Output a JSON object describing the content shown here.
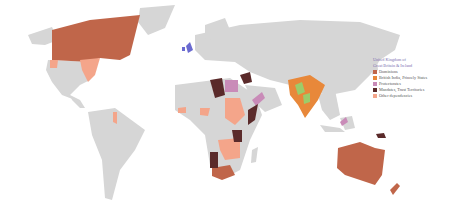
{
  "map": {
    "title": "British Empire territories",
    "land_color": "#d6d6d6",
    "ocean_color": "#ffffff"
  },
  "legend": {
    "title_line1": "United Kingdom of",
    "title_line2": "Great Britain & Ireland",
    "uk_color": "#6a6ad0",
    "items": [
      {
        "label": "Dominions",
        "color": "#c0664a"
      },
      {
        "label": "British India, Princely States",
        "color": "#e8883a"
      },
      {
        "label": "Protectorates",
        "color": "#c98bb8"
      },
      {
        "label": "Mandates, Trust Territories",
        "color": "#5a2a2a"
      },
      {
        "label": "Other dependencies",
        "color": "#f4a58a"
      }
    ]
  }
}
